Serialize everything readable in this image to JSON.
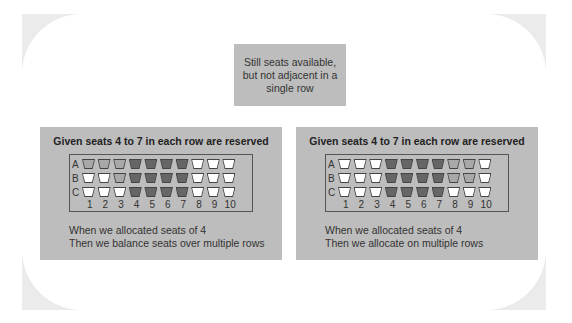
{
  "note": {
    "text": "Still seats available, but not adjacent in a single row"
  },
  "colors": {
    "frame": "#ebebeb",
    "panel": "#bdbdbd",
    "reserved": "#666666",
    "allocated": "#a8a8a8",
    "free": "#ffffff"
  },
  "panels": [
    {
      "title": "Given seats 4 to 7 in each row are reserved",
      "rows": [
        {
          "label": "A",
          "seats": [
            "light",
            "light",
            "light",
            "dark",
            "dark",
            "dark",
            "dark",
            "white",
            "white",
            "white"
          ]
        },
        {
          "label": "B",
          "seats": [
            "white",
            "white",
            "light",
            "dark",
            "dark",
            "dark",
            "dark",
            "white",
            "white",
            "white"
          ]
        },
        {
          "label": "C",
          "seats": [
            "white",
            "white",
            "white",
            "dark",
            "dark",
            "dark",
            "dark",
            "white",
            "white",
            "white"
          ]
        }
      ],
      "numbers": [
        "1",
        "2",
        "3",
        "4",
        "5",
        "6",
        "7",
        "8",
        "9",
        "10"
      ],
      "caption_line1": "When we allocated seats of 4",
      "caption_line2": "Then we balance seats over multiple rows"
    },
    {
      "title": "Given seats 4 to 7 in each row are reserved",
      "rows": [
        {
          "label": "A",
          "seats": [
            "white",
            "white",
            "white",
            "dark",
            "dark",
            "dark",
            "dark",
            "light",
            "light",
            "white"
          ]
        },
        {
          "label": "B",
          "seats": [
            "white",
            "white",
            "white",
            "dark",
            "dark",
            "dark",
            "dark",
            "light",
            "light",
            "white"
          ]
        },
        {
          "label": "C",
          "seats": [
            "white",
            "white",
            "white",
            "dark",
            "dark",
            "dark",
            "dark",
            "white",
            "white",
            "white"
          ]
        }
      ],
      "numbers": [
        "1",
        "2",
        "3",
        "4",
        "5",
        "6",
        "7",
        "8",
        "9",
        "10"
      ],
      "caption_line1": "When we allocated seats of 4",
      "caption_line2": "Then we allocate on multiple rows"
    }
  ]
}
